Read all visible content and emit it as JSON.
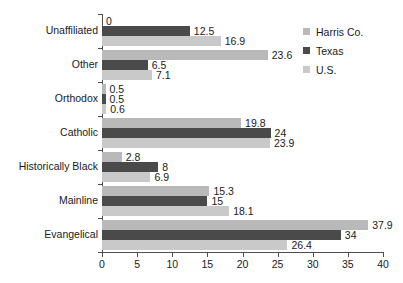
{
  "chart_data": {
    "type": "bar",
    "orientation": "horizontal",
    "title": "",
    "subtitle": "",
    "xlabel": "",
    "ylabel": "",
    "xlim": [
      0,
      40
    ],
    "xticks": [
      0,
      5,
      10,
      15,
      20,
      25,
      30,
      35,
      40
    ],
    "xticklabels": [
      "0",
      "5",
      "10",
      "15",
      "20",
      "25",
      "30",
      "35",
      "40"
    ],
    "grid": false,
    "legend_position": "top-right",
    "categories": [
      "Unaffiliated",
      "Other",
      "Orthodox",
      "Catholic",
      "Historically Black",
      "Mainline",
      "Evangelical"
    ],
    "series": [
      {
        "name": "Harris Co.",
        "color": "#b9b9b9",
        "values": [
          0,
          23.6,
          0.5,
          19.8,
          2.8,
          15.3,
          37.9
        ],
        "labels": [
          "0",
          "23.6",
          "0.5",
          "19.8",
          "2.8",
          "15.3",
          "37.9"
        ]
      },
      {
        "name": "Texas",
        "color": "#4a4a4a",
        "values": [
          12.5,
          6.5,
          0.5,
          24,
          8,
          15,
          34
        ],
        "labels": [
          "12.5",
          "6.5",
          "0.5",
          "24",
          "8",
          "15",
          "34"
        ]
      },
      {
        "name": "U.S.",
        "color": "#c9c9c9",
        "values": [
          16.9,
          7.1,
          0.6,
          23.9,
          6.9,
          18.1,
          26.4
        ],
        "labels": [
          "16.9",
          "7.1",
          "0.6",
          "23.9",
          "6.9",
          "18.1",
          "26.4"
        ]
      }
    ]
  },
  "legend": {
    "items": [
      {
        "label": "Harris Co.",
        "color": "#b9b9b9"
      },
      {
        "label": "Texas",
        "color": "#4a4a4a"
      },
      {
        "label": "U.S.",
        "color": "#c9c9c9"
      }
    ]
  }
}
